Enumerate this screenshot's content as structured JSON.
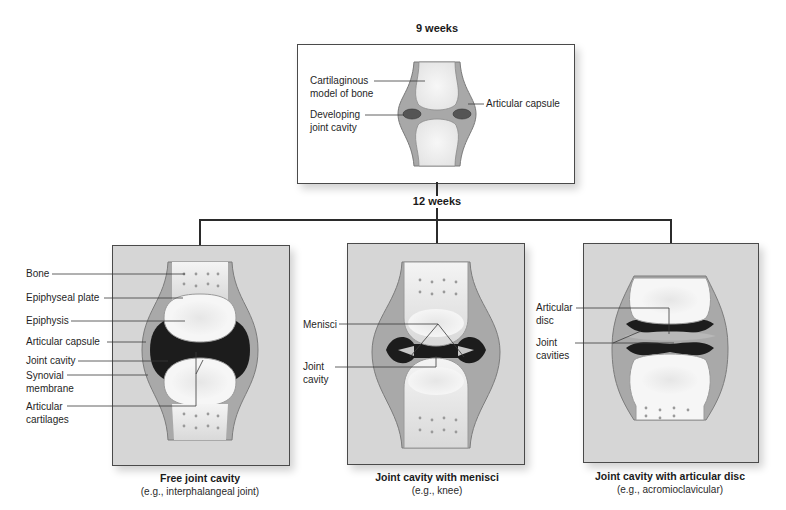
{
  "stages": {
    "early": {
      "title": "9 weeks"
    },
    "late": {
      "title": "12 weeks"
    }
  },
  "top_panel": {
    "labels": {
      "cartilaginous_model_line1": "Cartilaginous",
      "cartilaginous_model_line2": "model of bone",
      "developing_cavity_line1": "Developing",
      "developing_cavity_line2": "joint cavity",
      "articular_capsule": "Articular capsule"
    }
  },
  "panels": [
    {
      "title": "Free joint cavity",
      "subtitle": "(e.g., interphalangeal joint)",
      "labels": [
        {
          "line1": "Bone",
          "line2": ""
        },
        {
          "line1": "Epiphyseal plate",
          "line2": ""
        },
        {
          "line1": "Epiphysis",
          "line2": ""
        },
        {
          "line1": "Articular capsule",
          "line2": ""
        },
        {
          "line1": "Joint cavity",
          "line2": ""
        },
        {
          "line1": "Synovial",
          "line2": "membrane"
        },
        {
          "line1": "Articular",
          "line2": "cartilages"
        }
      ]
    },
    {
      "title": "Joint cavity with menisci",
      "subtitle": "(e.g., knee)",
      "labels": [
        {
          "line1": "Menisci",
          "line2": ""
        },
        {
          "line1": "Joint",
          "line2": "cavity"
        }
      ]
    },
    {
      "title": "Joint cavity with articular disc",
      "subtitle": "(e.g., acromioclavicular)",
      "labels": [
        {
          "line1": "Articular",
          "line2": "disc"
        },
        {
          "line1": "Joint",
          "line2": "cavities"
        }
      ]
    }
  ],
  "colors": {
    "panel_bg": "#d6d6d6",
    "capsule": "#9a9a9a",
    "cartilage": "#f2f2f2",
    "cavity": "#1e1e1e",
    "leader_line": "#3a3a3a"
  }
}
